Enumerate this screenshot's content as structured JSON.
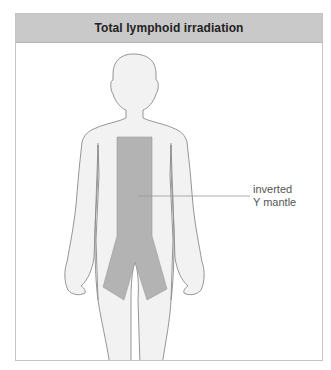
{
  "header": {
    "title": "Total lymphoid irradiation"
  },
  "annotation": {
    "line1": "inverted",
    "line2": "Y mantle"
  },
  "colors": {
    "header_bg": "#c9c9c9",
    "body_fill": "#f2f2f2",
    "outline": "#8a8a8a",
    "mantle_fill": "#b3b3b3",
    "border": "#c4c4c4"
  }
}
